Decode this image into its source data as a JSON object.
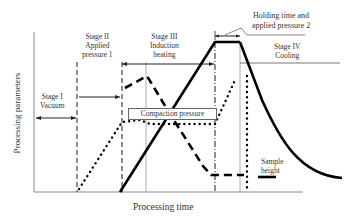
{
  "diagram": {
    "axes": {
      "y_label": "Processing parameters",
      "x_label": "Processing time"
    },
    "stages": [
      {
        "name": "Stage I",
        "description": "Vacuum"
      },
      {
        "name": "Stage II",
        "description1": "Applied",
        "description2": "pressure 1"
      },
      {
        "name": "Stage III",
        "description1": "Induction",
        "description2": "heating"
      },
      {
        "name": "Stage IV",
        "description": "Cooling"
      }
    ],
    "annotations": {
      "holding_line1": "Holding time and",
      "holding_line2": "applied pressure 2",
      "compaction": "Compaction pressure",
      "sample_line1": "Sample",
      "sample_line2": "height"
    },
    "curves": [
      {
        "name": "temperature",
        "style": "solid"
      },
      {
        "name": "pressure",
        "style": "dotted"
      },
      {
        "name": "sample height",
        "style": "dashed"
      }
    ],
    "colors": {
      "line": "#000000",
      "axis": "#777777",
      "text": "#333333"
    }
  }
}
